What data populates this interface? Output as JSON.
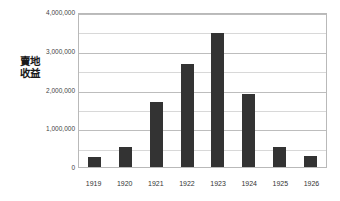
{
  "chart_data": {
    "type": "bar",
    "title": "",
    "subtitle": "",
    "xlabel": "",
    "ylabel": "賣地收益",
    "categories": [
      "1919",
      "1920",
      "1921",
      "1922",
      "1923",
      "1924",
      "1925",
      "1926"
    ],
    "values": [
      270000,
      520000,
      1700000,
      2700000,
      3500000,
      1900000,
      520000,
      280000
    ],
    "series": [
      {
        "name": "賣地收益",
        "values": [
          270000,
          520000,
          1700000,
          2700000,
          3500000,
          1900000,
          520000,
          280000
        ]
      }
    ],
    "ylim": [
      0,
      4000000
    ],
    "y_major_ticks": [
      0,
      1000000,
      2000000,
      3000000,
      4000000
    ],
    "y_major_tick_labels": [
      "0",
      "1,000,000",
      "2,000,000",
      "3,000,000",
      "4,000,000"
    ],
    "y_minor_ticks": [
      500000,
      1500000,
      2500000,
      3500000
    ],
    "grid": true,
    "grid_axis": "y",
    "legend": false,
    "legend_position": "none",
    "bar_color": "#333333",
    "gridline_color": "#cccccc",
    "plot_border_color": "#b9b9b9",
    "background_color": "#ffffff",
    "annotations": []
  },
  "axis": {
    "y_title": "賣地收益",
    "y_labels": [
      "4,000,000",
      "3,000,000",
      "2,000,000",
      "1,000,000",
      "0"
    ],
    "x_labels": [
      "1919",
      "1920",
      "1921",
      "1922",
      "1923",
      "1924",
      "1925",
      "1926"
    ]
  }
}
